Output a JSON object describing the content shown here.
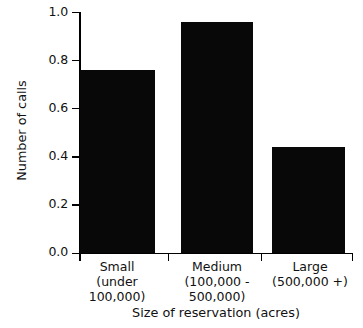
{
  "chart_data": {
    "type": "bar",
    "title": "",
    "subtitle": "",
    "xlabel": "Size of reservation (acres)",
    "ylabel": "Number of calls",
    "categories": [
      "Small",
      "Medium",
      "Large"
    ],
    "category_sublabels": [
      [
        "(under",
        "100,000)"
      ],
      [
        "(100,000 -",
        "500,000)"
      ],
      [
        "(500,000 +)"
      ]
    ],
    "values": [
      0.76,
      0.96,
      0.44
    ],
    "ylim": [
      0.0,
      1.0
    ],
    "ytick_labels": [
      "1.0",
      "0.8",
      "0.6",
      "0.4",
      "0.2",
      "0.0"
    ],
    "ytick_values": [
      1.0,
      0.8,
      0.6,
      0.4,
      0.2,
      0.0
    ],
    "grid": false,
    "legend": "none",
    "bar_color": "#080808",
    "axis_color": "#000000",
    "background_color": "#ffffff"
  }
}
